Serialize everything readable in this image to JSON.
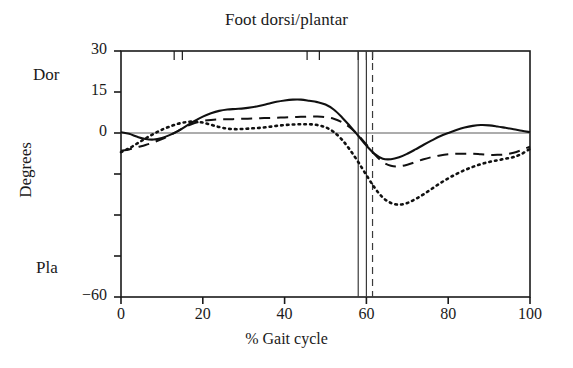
{
  "chart_data": {
    "type": "line",
    "title": "Foot dorsi/plantar",
    "xlabel": "% Gait cycle",
    "ylabel": "Degrees",
    "axis_annotations": {
      "top_label": "Dor",
      "bottom_label": "Pla"
    },
    "xlim": [
      0,
      100
    ],
    "ylim": [
      -60,
      30
    ],
    "xticks": [
      0,
      20,
      40,
      60,
      80,
      100
    ],
    "xtick_labels": [
      "0",
      "20",
      "40",
      "60",
      "80",
      "100"
    ],
    "yticks": [
      30,
      15,
      0,
      -15,
      -30,
      -45,
      -60
    ],
    "ytick_labels": [
      "30",
      "15",
      "0",
      "",
      "",
      "",
      "−60"
    ],
    "grid": false,
    "zero_line": true,
    "legend": null,
    "event_markers": {
      "description": "vertical event lines near toe-off",
      "solid": [
        58.0,
        60.0
      ],
      "dashed": [
        61.5
      ]
    },
    "top_axis_event_ticks": [
      13.0,
      15.0,
      45.5,
      48.5,
      58.0,
      60.0,
      61.5
    ],
    "series": [
      {
        "name": "solid",
        "style": "solid",
        "x": [
          0,
          2,
          4,
          6,
          8,
          10,
          12,
          14,
          16,
          18,
          20,
          22,
          24,
          26,
          28,
          30,
          32,
          34,
          36,
          38,
          40,
          42,
          44,
          46,
          48,
          50,
          52,
          54,
          56,
          58,
          60,
          62,
          64,
          66,
          68,
          70,
          72,
          74,
          76,
          78,
          80,
          82,
          84,
          86,
          88,
          90,
          92,
          94,
          96,
          98,
          100
        ],
        "values": [
          0.3,
          -0.3,
          -1.4,
          -2.2,
          -2.4,
          -1.8,
          -0.7,
          0.8,
          2.6,
          4.4,
          6.0,
          7.2,
          8.1,
          8.6,
          8.8,
          9.0,
          9.4,
          10.0,
          10.7,
          11.4,
          11.9,
          12.2,
          12.2,
          11.8,
          11.3,
          10.4,
          8.6,
          5.8,
          2.5,
          -1.0,
          -4.6,
          -7.6,
          -9.4,
          -9.6,
          -8.9,
          -7.6,
          -6.0,
          -4.3,
          -2.7,
          -1.2,
          0.0,
          1.1,
          2.0,
          2.6,
          2.9,
          2.8,
          2.4,
          1.9,
          1.4,
          0.8,
          0.3
        ]
      },
      {
        "name": "dashed",
        "style": "dashed",
        "x": [
          0,
          2,
          4,
          6,
          8,
          10,
          12,
          14,
          16,
          18,
          20,
          22,
          24,
          26,
          28,
          30,
          32,
          34,
          36,
          38,
          40,
          42,
          44,
          46,
          48,
          50,
          52,
          54,
          56,
          58,
          60,
          62,
          64,
          66,
          68,
          70,
          72,
          74,
          76,
          78,
          80,
          82,
          84,
          86,
          88,
          90,
          92,
          94,
          96,
          98,
          100
        ],
        "values": [
          -6.5,
          -6.0,
          -5.2,
          -4.4,
          -3.4,
          -2.2,
          -0.8,
          0.8,
          2.4,
          3.6,
          4.4,
          4.8,
          5.0,
          5.0,
          5.1,
          5.2,
          5.3,
          5.4,
          5.5,
          5.6,
          5.7,
          5.8,
          5.9,
          6.0,
          6.0,
          5.8,
          5.2,
          4.0,
          2.0,
          -0.8,
          -4.2,
          -7.8,
          -10.6,
          -12.0,
          -12.2,
          -11.6,
          -10.6,
          -9.6,
          -8.8,
          -8.2,
          -7.8,
          -7.6,
          -7.6,
          -7.6,
          -7.8,
          -8.0,
          -8.0,
          -7.8,
          -7.2,
          -6.2,
          -5.0
        ]
      },
      {
        "name": "dotted",
        "style": "dotted",
        "x": [
          0,
          2,
          4,
          6,
          8,
          10,
          12,
          14,
          16,
          18,
          20,
          22,
          24,
          26,
          28,
          30,
          32,
          34,
          36,
          38,
          40,
          42,
          44,
          46,
          48,
          50,
          52,
          54,
          56,
          58,
          60,
          62,
          64,
          66,
          68,
          70,
          72,
          74,
          76,
          78,
          80,
          82,
          84,
          86,
          88,
          90,
          92,
          94,
          96,
          98,
          100
        ],
        "values": [
          -7.0,
          -5.6,
          -3.8,
          -2.0,
          -0.3,
          1.2,
          2.4,
          3.4,
          4.0,
          4.2,
          3.8,
          3.0,
          2.2,
          1.6,
          1.4,
          1.5,
          1.7,
          1.9,
          2.2,
          2.6,
          2.9,
          3.1,
          3.2,
          3.2,
          2.9,
          2.1,
          0.4,
          -2.4,
          -6.2,
          -10.6,
          -15.4,
          -20.0,
          -23.6,
          -25.6,
          -26.2,
          -25.6,
          -24.2,
          -22.4,
          -20.4,
          -18.4,
          -16.6,
          -15.0,
          -13.6,
          -12.4,
          -11.4,
          -10.6,
          -10.0,
          -9.4,
          -8.8,
          -7.6,
          -5.8
        ]
      }
    ]
  }
}
